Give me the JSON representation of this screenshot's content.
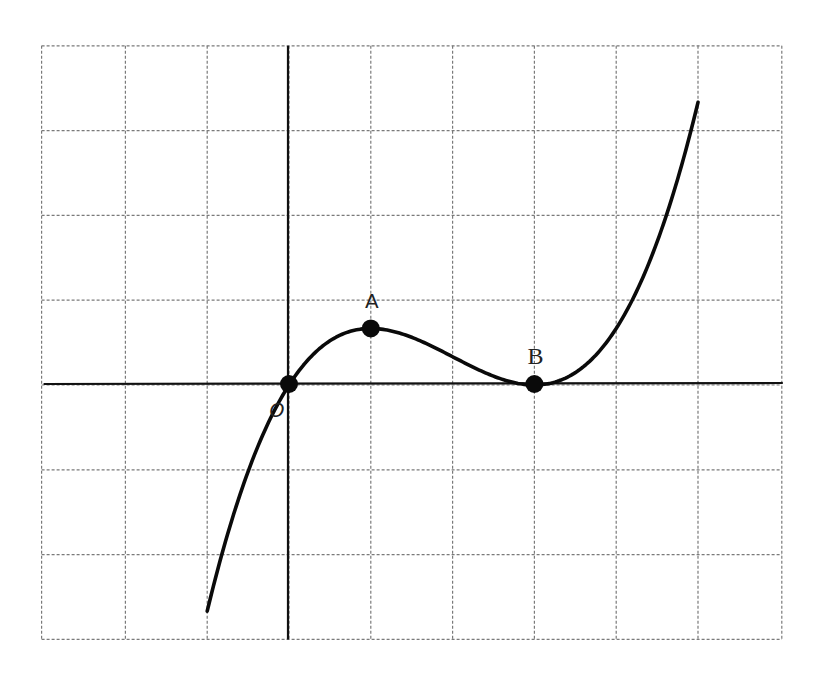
{
  "chart_data": {
    "type": "line",
    "title": "",
    "xlabel": "",
    "ylabel": "",
    "function": "y = (1/6) * x * (x - 3)^2",
    "grid": true,
    "grid_style": "dashed",
    "x_range": [
      -3,
      6
    ],
    "y_range": [
      -3,
      4
    ],
    "xlim_plot": [
      -1,
      5
    ],
    "series": [
      {
        "name": "curve",
        "x": [
          -1,
          -0.5,
          0,
          0.5,
          1,
          1.5,
          2,
          2.5,
          3,
          3.5,
          4,
          4.5,
          5
        ],
        "values": [
          -2.667,
          -1.021,
          0,
          0.521,
          0.667,
          0.563,
          0.333,
          0.104,
          0,
          0.146,
          0.667,
          1.688,
          3.333
        ]
      }
    ],
    "points": [
      {
        "label": "O",
        "x": 0,
        "y": 0
      },
      {
        "label": "A",
        "x": 1,
        "y": 0.667
      },
      {
        "label": "B",
        "x": 3,
        "y": 0
      }
    ],
    "annotations": [
      "O",
      "A",
      "B"
    ],
    "legend": null
  },
  "colors": {
    "curve": "#0a0a0a",
    "axis": "#111111",
    "grid": "#7a7a7a",
    "background": "#ffffff"
  },
  "labels": {
    "origin": "O",
    "point_a": "A",
    "point_b": "B"
  }
}
